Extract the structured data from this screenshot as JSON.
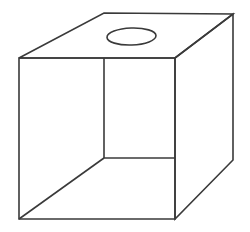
{
  "figure": {
    "type": "line-drawing",
    "background_color": "#ffffff",
    "stroke_color": "#3a3a3a",
    "stroke_width": 1.6,
    "fill_color": "#ffffff",
    "canvas": {
      "width": 250,
      "height": 232
    },
    "vertices": {
      "front_top_left": [
        19,
        58
      ],
      "front_top_right": [
        175,
        58
      ],
      "front_bottom_right": [
        175,
        219
      ],
      "front_bottom_left": [
        19,
        219
      ],
      "back_top_left": [
        104,
        13
      ],
      "back_top_right": [
        233,
        14
      ],
      "back_bottom_right": [
        233,
        160
      ],
      "interior_corner": [
        104,
        158
      ]
    },
    "shapes": {
      "top_face": "M19,58 L104,13 L233,14 L175,58 Z",
      "right_face": "M175,58 L233,14 L233,160 L175,219 Z",
      "front_opening": "M19,58 L175,58 L175,219 L19,219 Z",
      "interior_vertical_edge": "M104,58 L104,158",
      "interior_horizontal_edge": "M104,158 L175,158",
      "interior_diagonal_edge": "M104,158 L19,219"
    },
    "hole": {
      "name": "circular-hole",
      "center_x": 131.5,
      "center_y": 36.5,
      "radius_x": 24.5,
      "radius_y": 8.5,
      "rotation_deg": -2
    }
  }
}
